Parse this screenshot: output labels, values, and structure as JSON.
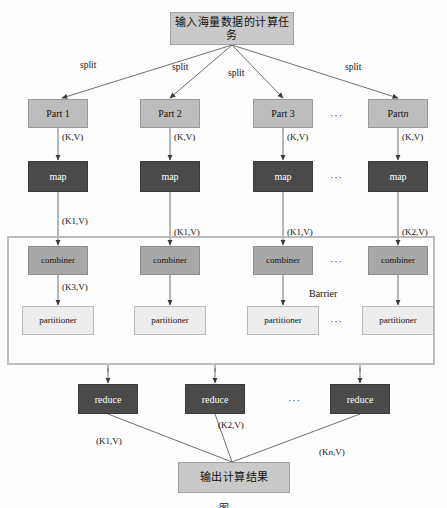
{
  "diagram": {
    "title_node": "输入海量数据的计算任务",
    "output_node": "输出计算结果",
    "barrier_label": "Barrier",
    "split_labels": [
      "split",
      "split",
      "split",
      "split"
    ],
    "ellipsis": "···",
    "colors": {
      "dark_node": "#4a4a4a",
      "mid_node": "#a8a8a8",
      "pale_node": "#ededed",
      "part_node": "#bdbdbd",
      "title_node": "#c9c9c9",
      "barrier_border": "#bdbdbd",
      "line": "#555555"
    },
    "columns": [
      {
        "part": "Part 1",
        "kv_in": "(K,V)",
        "map": "map",
        "kv_out": [
          "(K1,V)",
          "(K2,V)",
          "(K3,V)"
        ],
        "combiner": "combiner",
        "partitioner": "partitioner"
      },
      {
        "part": "Part 2",
        "kv_in": "(K,V)",
        "map": "map",
        "kv_out": [
          "(K1,V)",
          "(K3,V)"
        ],
        "combiner": "combiner",
        "partitioner": "partitioner"
      },
      {
        "part": "Part 3",
        "kv_in": "(K,V)",
        "map": "map",
        "kv_out": [
          "(K1,V)",
          "(K2,V)"
        ],
        "combiner": "combiner",
        "partitioner": "partitioner"
      },
      {
        "part_prefix": "Part ",
        "part_italic": "n",
        "kv_in": "(K,V)",
        "map": "map",
        "kv_out": [
          "(K2,V)",
          "(K3,V)"
        ],
        "combiner": "combiner",
        "partitioner": "partitioner"
      }
    ],
    "reduce_nodes": [
      {
        "label": "reduce",
        "out_prefix": "(K1,V)"
      },
      {
        "label": "reduce",
        "out_prefix": "(K2,V)"
      },
      {
        "label": "reduce",
        "out_prefix": "(K",
        "out_italic": "n",
        "out_suffix": ",V)"
      }
    ],
    "caption": "图"
  }
}
